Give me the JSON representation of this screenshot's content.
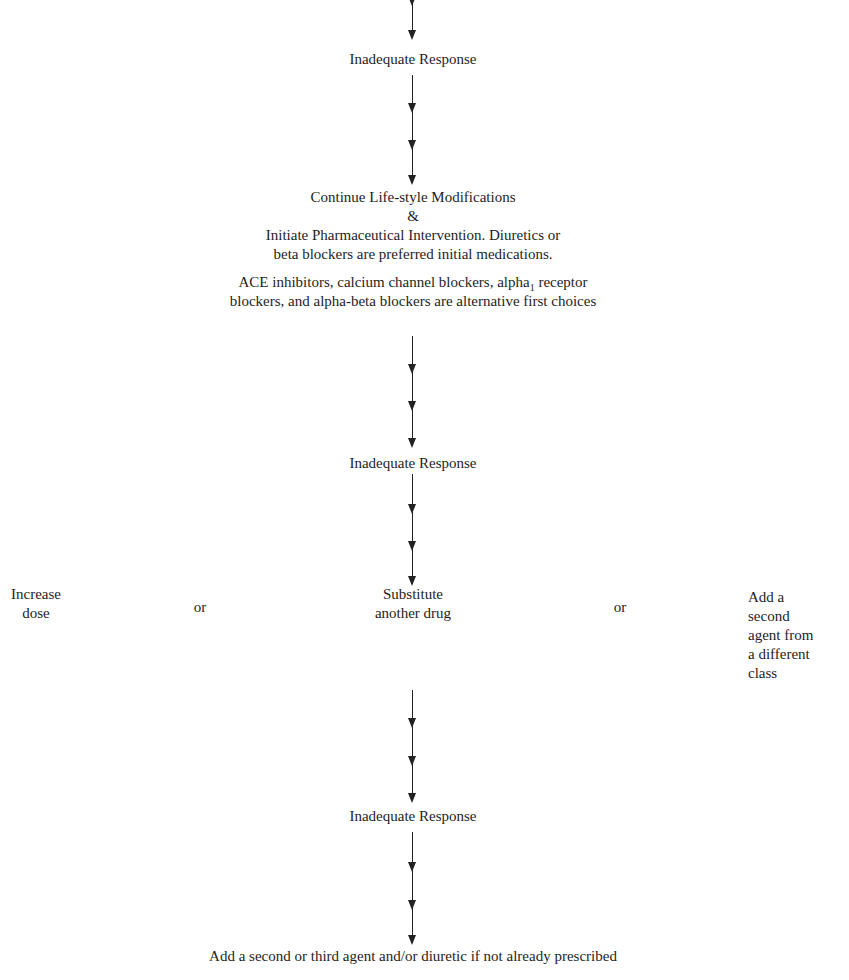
{
  "flowchart": {
    "step1_response": "Inadequate Response",
    "step2": {
      "line1": "Continue Life-style Modifications",
      "line2": "&",
      "line3": "Initiate Pharmaceutical Intervention. Diuretics or",
      "line4": "beta blockers are preferred initial medications."
    },
    "alternatives": {
      "line1_a": "ACE inhibitors, calcium channel blockers, alpha",
      "line1_sub": "1",
      "line1_b": " receptor",
      "line2": "blockers, and alpha-beta blockers are alternative first choices"
    },
    "step3_response": "Inadequate Response",
    "options": {
      "left": {
        "line1": "Increase",
        "line2": "dose"
      },
      "or_left": "or",
      "center": {
        "line1": "Substitute",
        "line2": "another drug"
      },
      "or_right": "or",
      "right": {
        "line1": "Add a",
        "line2": "second",
        "line3": "agent from",
        "line4": "a different",
        "line5": "class"
      }
    },
    "step4_response": "Inadequate Response",
    "final_step": "Add a second or third agent and/or diuretic if not already prescribed"
  }
}
